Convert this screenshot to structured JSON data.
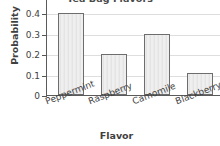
{
  "chart_data": {
    "type": "bar",
    "title": "Tea Bag Flavors",
    "xlabel": "Flavor",
    "ylabel": "Probability",
    "categories": [
      "Peppermint",
      "Raspberry",
      "Camomile",
      "Blackberry"
    ],
    "values": [
      0.4,
      0.2,
      0.3,
      0.11
    ],
    "ylim": [
      0,
      0.44
    ],
    "yticks": [
      0,
      0.1,
      0.2,
      0.3,
      0.4
    ],
    "ytick_labels": [
      "0",
      "0.1",
      "0.2",
      "0.3",
      "0.4"
    ],
    "grid": true,
    "grid_axis": "y",
    "legend": false,
    "legend_position": "none",
    "bar_fill_color": "#eaeaea",
    "bar_edge_color": "#6d6d6d",
    "grid_color": "#dedede",
    "axis_color": "#5a5a5a",
    "text_color": "#3f3f3f",
    "background_color": "#ffffff"
  }
}
